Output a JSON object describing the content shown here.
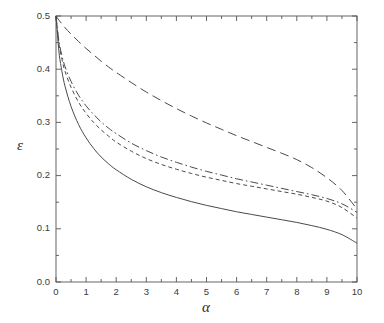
{
  "figure": {
    "background_color": "#ffffff",
    "axis_color": "#555555",
    "curve_color": "#4a4a4a"
  },
  "chart_data": {
    "type": "line",
    "title": "",
    "subtitle": "",
    "xlabel": "α",
    "ylabel": "ε",
    "xlim": [
      0,
      10
    ],
    "ylim": [
      0.0,
      0.5
    ],
    "grid": false,
    "legend": "none",
    "x_ticks": [
      0,
      1,
      2,
      3,
      4,
      5,
      6,
      7,
      8,
      9,
      10
    ],
    "x_tick_labels": [
      "0",
      "1",
      "2",
      "3",
      "4",
      "5",
      "6",
      "7",
      "8",
      "9",
      "10"
    ],
    "x_minor_tick_step": 0.5,
    "y_ticks": [
      0.0,
      0.1,
      0.2,
      0.3,
      0.4,
      0.5
    ],
    "y_tick_labels": [
      "0.0",
      "0.1",
      "0.2",
      "0.3",
      "0.4",
      "0.5"
    ],
    "y_minor_tick_step": 0.05,
    "x": [
      0,
      0.1,
      0.2,
      0.3,
      0.5,
      0.75,
      1,
      1.25,
      1.5,
      1.75,
      2,
      2.5,
      3,
      3.5,
      4,
      4.5,
      5,
      5.5,
      6,
      6.5,
      7,
      7.5,
      8,
      8.5,
      9,
      9.5,
      10
    ],
    "series": [
      {
        "name": "curve-long-dash",
        "style": "long-dash",
        "dasharray": "9,5",
        "values": [
          0.5,
          0.492,
          0.485,
          0.478,
          0.466,
          0.452,
          0.439,
          0.427,
          0.415,
          0.404,
          0.394,
          0.375,
          0.357,
          0.341,
          0.326,
          0.312,
          0.299,
          0.287,
          0.275,
          0.264,
          0.253,
          0.242,
          0.23,
          0.215,
          0.196,
          0.172,
          0.137
        ]
      },
      {
        "name": "curve-dash-dot",
        "style": "dash-dot",
        "dasharray": "8,3,1.6,3",
        "values": [
          0.5,
          0.452,
          0.425,
          0.405,
          0.377,
          0.351,
          0.331,
          0.315,
          0.301,
          0.289,
          0.279,
          0.261,
          0.247,
          0.235,
          0.225,
          0.216,
          0.208,
          0.201,
          0.194,
          0.188,
          0.182,
          0.176,
          0.17,
          0.164,
          0.157,
          0.147,
          0.131
        ]
      },
      {
        "name": "curve-short-dash",
        "style": "short-dash",
        "dasharray": "4,3",
        "values": [
          0.5,
          0.447,
          0.418,
          0.396,
          0.366,
          0.338,
          0.317,
          0.3,
          0.286,
          0.274,
          0.263,
          0.246,
          0.232,
          0.221,
          0.212,
          0.204,
          0.197,
          0.191,
          0.185,
          0.18,
          0.175,
          0.17,
          0.165,
          0.159,
          0.152,
          0.14,
          0.12
        ]
      },
      {
        "name": "curve-solid",
        "style": "solid",
        "dasharray": "",
        "values": [
          0.5,
          0.432,
          0.395,
          0.368,
          0.33,
          0.296,
          0.271,
          0.251,
          0.235,
          0.222,
          0.211,
          0.193,
          0.179,
          0.168,
          0.159,
          0.151,
          0.144,
          0.138,
          0.132,
          0.127,
          0.122,
          0.117,
          0.112,
          0.106,
          0.099,
          0.089,
          0.073
        ]
      }
    ]
  }
}
